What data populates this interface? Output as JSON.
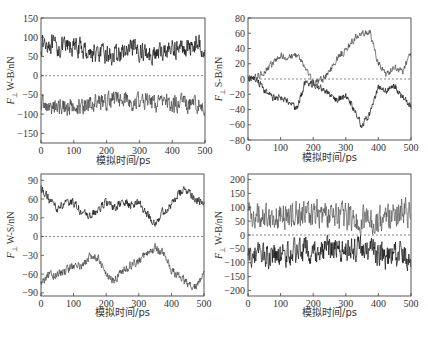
{
  "chart_data": [
    {
      "id": "a",
      "type": "line",
      "ylabel": {
        "symbol": "F",
        "subscript": "⊥",
        "text": "W-B/nN"
      },
      "xlabel": "模拟时间/ps",
      "xlim": [
        0,
        500
      ],
      "ylim": [
        -175,
        150
      ],
      "xticks": [
        0,
        100,
        200,
        300,
        400,
        500
      ],
      "yticks": [
        150,
        100,
        50,
        0,
        -50,
        -100,
        -150
      ],
      "zero_line": "dashed",
      "x": [
        0,
        25,
        50,
        75,
        100,
        125,
        150,
        175,
        200,
        225,
        250,
        275,
        300,
        325,
        350,
        375,
        400,
        425,
        450,
        475,
        500
      ],
      "series": [
        {
          "name": "upper",
          "color": "#111111",
          "noise": 22,
          "values": [
            80,
            85,
            70,
            75,
            75,
            70,
            60,
            55,
            55,
            50,
            60,
            65,
            65,
            60,
            55,
            65,
            70,
            70,
            75,
            85,
            70
          ]
        },
        {
          "name": "lower",
          "color": "#444444",
          "noise": 20,
          "values": [
            -70,
            -85,
            -80,
            -80,
            -85,
            -80,
            -70,
            -70,
            -65,
            -60,
            -60,
            -70,
            -65,
            -65,
            -75,
            -60,
            -75,
            -70,
            -75,
            -75,
            -80
          ]
        }
      ]
    },
    {
      "id": "b",
      "type": "line",
      "ylabel": {
        "symbol": "F",
        "subscript": "⊥",
        "text": "S-B/nN"
      },
      "xlabel": "模拟时间/ps",
      "xlim": [
        0,
        500
      ],
      "ylim": [
        -80,
        80
      ],
      "xticks": [
        0,
        100,
        200,
        300,
        400,
        500
      ],
      "yticks": [
        80,
        60,
        40,
        20,
        0,
        -20,
        -40,
        -60,
        -80
      ],
      "zero_line": "dashed",
      "x": [
        0,
        25,
        50,
        75,
        100,
        125,
        150,
        175,
        200,
        225,
        250,
        275,
        300,
        325,
        350,
        375,
        400,
        425,
        450,
        475,
        500
      ],
      "series": [
        {
          "name": "upper",
          "color": "#444444",
          "noise": 4,
          "values": [
            0,
            2,
            10,
            20,
            30,
            28,
            32,
            15,
            -5,
            -2,
            10,
            28,
            38,
            52,
            60,
            60,
            20,
            5,
            15,
            10,
            35
          ]
        },
        {
          "name": "lower",
          "color": "#111111",
          "noise": 4,
          "values": [
            0,
            0,
            -15,
            -25,
            -25,
            -30,
            -40,
            -5,
            -8,
            -12,
            -20,
            -28,
            -20,
            -40,
            -62,
            -45,
            -10,
            -15,
            -10,
            -25,
            -35
          ]
        }
      ]
    },
    {
      "id": "c",
      "type": "line",
      "ylabel": {
        "symbol": "F",
        "subscript": "⊥",
        "text": "W-S/nN"
      },
      "xlabel": "模拟时间/ps",
      "xlim": [
        0,
        500
      ],
      "ylim": [
        -95,
        100
      ],
      "xticks": [
        0,
        100,
        200,
        300,
        400,
        500
      ],
      "yticks": [
        90,
        60,
        30,
        0,
        -30,
        -60,
        -90
      ],
      "zero_line": "dashed",
      "x": [
        0,
        25,
        50,
        75,
        100,
        125,
        150,
        175,
        200,
        225,
        250,
        275,
        300,
        325,
        350,
        375,
        400,
        425,
        450,
        475,
        500
      ],
      "series": [
        {
          "name": "upper",
          "color": "#111111",
          "noise": 6,
          "values": [
            78,
            58,
            45,
            52,
            55,
            38,
            32,
            42,
            55,
            45,
            55,
            50,
            55,
            35,
            22,
            40,
            50,
            70,
            75,
            60,
            50
          ]
        },
        {
          "name": "lower",
          "color": "#444444",
          "noise": 6,
          "values": [
            -75,
            -62,
            -60,
            -55,
            -45,
            -50,
            -30,
            -35,
            -60,
            -70,
            -55,
            -45,
            -40,
            -25,
            -18,
            -25,
            -55,
            -65,
            -75,
            -80,
            -60
          ]
        }
      ]
    },
    {
      "id": "d",
      "type": "line",
      "ylabel": {
        "symbol": "F",
        "subscript": "⊥",
        "text": "W-B/nN"
      },
      "xlabel": "模拟时间/ps",
      "xlim": [
        0,
        500
      ],
      "ylim": [
        -220,
        220
      ],
      "xticks": [
        0,
        100,
        200,
        300,
        400,
        500
      ],
      "yticks": [
        200,
        150,
        100,
        50,
        0,
        -50,
        -100,
        -150,
        -200
      ],
      "zero_line": "dashed",
      "x": [
        0,
        25,
        50,
        75,
        100,
        125,
        150,
        175,
        200,
        225,
        250,
        275,
        300,
        325,
        350,
        375,
        400,
        425,
        450,
        475,
        500
      ],
      "series": [
        {
          "name": "upper",
          "color": "#555555",
          "noise": 45,
          "values": [
            80,
            70,
            75,
            70,
            65,
            70,
            75,
            70,
            80,
            75,
            60,
            70,
            60,
            55,
            50,
            55,
            50,
            70,
            75,
            80,
            70
          ]
        },
        {
          "name": "lower",
          "color": "#111111",
          "noise": 40,
          "values": [
            -80,
            -75,
            -70,
            -75,
            -80,
            -70,
            -60,
            -55,
            -50,
            -55,
            -45,
            -50,
            -55,
            -50,
            -50,
            -55,
            -60,
            -80,
            -70,
            -75,
            -80
          ]
        }
      ]
    }
  ]
}
